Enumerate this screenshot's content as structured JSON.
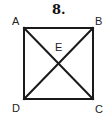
{
  "problem": {
    "number": "8."
  },
  "figure": {
    "type": "square-with-diagonals",
    "vertices": {
      "A": {
        "label": "A",
        "x": 24,
        "y": 28
      },
      "B": {
        "label": "B",
        "x": 93,
        "y": 28
      },
      "C": {
        "label": "C",
        "x": 93,
        "y": 99
      },
      "D": {
        "label": "D",
        "x": 24,
        "y": 99
      }
    },
    "intersection": {
      "label": "E",
      "x": 58.5,
      "y": 63.5
    },
    "segments": [
      "AB",
      "BC",
      "CD",
      "DA",
      "AC",
      "BD"
    ],
    "stroke_color": "#1a1a1a",
    "stroke_width": 2
  }
}
